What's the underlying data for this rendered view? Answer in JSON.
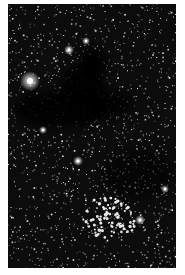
{
  "image": {
    "subject": "dark nebula star field",
    "background_color": "#ffffff",
    "field_color": "#0c0c0c",
    "frame": {
      "x": 8,
      "y": 4,
      "width": 168,
      "height": 264
    },
    "star_count": 1400,
    "seed": 7,
    "bright_stars": [
      {
        "x": 22,
        "y": 77,
        "r": 5
      },
      {
        "x": 61,
        "y": 46,
        "r": 2.5
      },
      {
        "x": 78,
        "y": 37,
        "r": 2
      },
      {
        "x": 70,
        "y": 157,
        "r": 2.5
      },
      {
        "x": 132,
        "y": 216,
        "r": 2.5
      },
      {
        "x": 157,
        "y": 185,
        "r": 2
      },
      {
        "x": 35,
        "y": 126,
        "r": 2
      }
    ],
    "dark_regions": [
      {
        "cx": 85,
        "cy": 58,
        "rx": 14,
        "ry": 14,
        "opacity": 0.95
      },
      {
        "cx": 75,
        "cy": 80,
        "rx": 22,
        "ry": 18,
        "opacity": 0.9
      },
      {
        "cx": 55,
        "cy": 105,
        "rx": 50,
        "ry": 18,
        "opacity": 0.9
      },
      {
        "cx": 100,
        "cy": 100,
        "rx": 25,
        "ry": 15,
        "opacity": 0.7
      },
      {
        "cx": 130,
        "cy": 170,
        "rx": 35,
        "ry": 25,
        "opacity": 0.55
      }
    ],
    "cluster": {
      "cx": 100,
      "cy": 215,
      "rx": 28,
      "ry": 22,
      "count": 90
    }
  }
}
